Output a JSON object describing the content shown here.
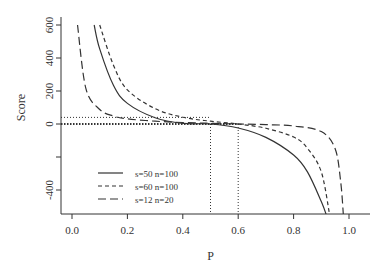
{
  "chart_data": {
    "type": "line",
    "title": "",
    "xlabel": "P",
    "ylabel": "Score",
    "xlim": [
      0.0,
      1.0
    ],
    "ylim": [
      -500,
      600
    ],
    "xticks": [
      "0.0",
      "0.2",
      "0.4",
      "0.6",
      "0.8",
      "1.0"
    ],
    "yticks": [
      "-400",
      "",
      "0",
      "200",
      "400",
      "600"
    ],
    "grid": false,
    "legend_position": "bottom-left",
    "series": [
      {
        "name": "s=50  n=100",
        "style": "solid",
        "x": [
          0.08,
          0.1,
          0.15,
          0.2,
          0.3,
          0.4,
          0.5,
          0.6,
          0.7,
          0.8,
          0.85,
          0.9,
          0.92
        ],
        "y": [
          600,
          455,
          233,
          125,
          38,
          4,
          0,
          -24,
          -81,
          -188,
          -290,
          -470,
          -560
        ]
      },
      {
        "name": "s=60  n=100",
        "style": "short-dash",
        "x": [
          0.1,
          0.15,
          0.2,
          0.3,
          0.4,
          0.5,
          0.6,
          0.7,
          0.8,
          0.85,
          0.9,
          0.93
        ],
        "y": [
          600,
          355,
          207,
          93,
          41,
          17,
          0,
          -26,
          -79,
          -147,
          -290,
          -550
        ]
      },
      {
        "name": "s=12  n=20",
        "style": "long-dash",
        "x": [
          0.02,
          0.05,
          0.1,
          0.15,
          0.2,
          0.3,
          0.4,
          0.5,
          0.6,
          0.7,
          0.8,
          0.9,
          0.95,
          0.97,
          0.98
        ],
        "y": [
          600,
          216,
          88,
          48,
          31,
          17,
          9,
          4,
          0,
          -4,
          -12,
          -46,
          -150,
          -350,
          -560
        ]
      }
    ],
    "reference_lines": [
      {
        "type": "horizontal",
        "y": 40,
        "style": "dotted"
      },
      {
        "type": "horizontal",
        "y": 0,
        "style": "dotted-thick"
      },
      {
        "type": "vertical",
        "x": 0.5,
        "style": "dotted"
      },
      {
        "type": "vertical",
        "x": 0.6,
        "style": "dotted"
      }
    ]
  }
}
